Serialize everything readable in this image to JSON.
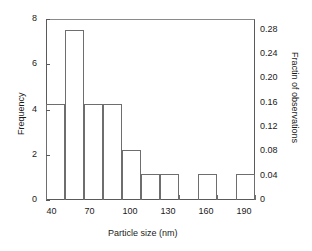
{
  "chart_data": {
    "type": "bar",
    "title": "",
    "subtitle": "",
    "xlabel": "Particle size (nm)",
    "ylabel": "Frequency",
    "y2label": "Fractin of observations",
    "grid": false,
    "legend": null,
    "xlim": [
      32.5,
      197.5
    ],
    "ylim": [
      0,
      8
    ],
    "y2lim": [
      0,
      0.2978
    ],
    "bin_width": 15,
    "xtick_labels": [
      "40",
      "70",
      "100",
      "130",
      "160",
      "190"
    ],
    "xtick_values": [
      40,
      70,
      100,
      130,
      160,
      190
    ],
    "ytick_labels": [
      "0",
      "2",
      "4",
      "6",
      "8"
    ],
    "ytick_values": [
      0,
      2,
      4,
      6,
      8
    ],
    "y2tick_labels": [
      "0",
      "0.04",
      "0.08",
      "0.12",
      "0.16",
      "0.20",
      "0.24",
      "0.28"
    ],
    "y2tick_values": [
      0,
      0.04,
      0.08,
      0.12,
      0.16,
      0.2,
      0.24,
      0.28
    ],
    "bins": [
      {
        "left": 32.5,
        "right": 47.5,
        "center": 40,
        "frequency": 4.25,
        "fraction": 0.158
      },
      {
        "left": 47.5,
        "right": 62.5,
        "center": 55,
        "frequency": 7.5,
        "fraction": 0.279
      },
      {
        "left": 62.5,
        "right": 77.5,
        "center": 70,
        "frequency": 4.25,
        "fraction": 0.158
      },
      {
        "left": 77.5,
        "right": 92.5,
        "center": 85,
        "frequency": 4.25,
        "fraction": 0.158
      },
      {
        "left": 92.5,
        "right": 107.5,
        "center": 100,
        "frequency": 2.2,
        "fraction": 0.082
      },
      {
        "left": 107.5,
        "right": 122.5,
        "center": 115,
        "frequency": 1.15,
        "fraction": 0.043
      },
      {
        "left": 122.5,
        "right": 137.5,
        "center": 130,
        "frequency": 1.15,
        "fraction": 0.043
      },
      {
        "left": 137.5,
        "right": 152.5,
        "center": 145,
        "frequency": 0,
        "fraction": 0
      },
      {
        "left": 152.5,
        "right": 167.5,
        "center": 160,
        "frequency": 1.15,
        "fraction": 0.043
      },
      {
        "left": 167.5,
        "right": 182.5,
        "center": 175,
        "frequency": 0,
        "fraction": 0
      },
      {
        "left": 182.5,
        "right": 197.5,
        "center": 190,
        "frequency": 1.15,
        "fraction": 0.043
      }
    ],
    "categories": [
      "40",
      "55",
      "70",
      "85",
      "100",
      "115",
      "130",
      "145",
      "160",
      "175",
      "190"
    ],
    "values": [
      4.25,
      7.5,
      4.25,
      4.25,
      2.2,
      1.15,
      1.15,
      0,
      1.15,
      0,
      1.15
    ]
  },
  "style": {
    "frame_color": "#5a5a5a",
    "bar_edge_color": "#6e6e6e",
    "bar_fill_color": "#ffffff",
    "text_color": "#1a1a1a",
    "background": "#ffffff"
  }
}
